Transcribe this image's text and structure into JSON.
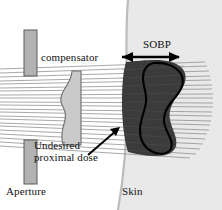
{
  "figure": {
    "labels": {
      "compensator": "compensator",
      "sobp": "SOBP",
      "undesired_dose_line1": "Undesired",
      "undesired_dose_line2": "proximal dose",
      "aperture": "Aperture",
      "skin": "Skin"
    },
    "colors": {
      "background": "#ffffff",
      "aperture_fill": "#b0b0b0",
      "aperture_stroke": "#555555",
      "compensator_fill": "#c9c9c9",
      "compensator_stroke": "#6a6a6a",
      "body_fill": "#e8e8e8",
      "skin_stroke": "#b8b8b8",
      "dose_region_fill": "#3a3a3a",
      "tumor_stroke": "#000000",
      "beam_line": "#8e8e8e",
      "text": "#121212",
      "arrow": "#000000"
    },
    "elements": {
      "aperture_upper_block": "vertical gray bar above beam gap",
      "aperture_lower_block": "vertical gray bar below beam gap",
      "compensator_shape": "light gray wedge with wavy left edge",
      "skin_boundary": "curved vertical body surface line",
      "dose_region": "dark shaded proximal dose volume",
      "tumor_outline": "S-shaped target volume contour",
      "sobp_arrow": "double-headed horizontal arrow",
      "pointer_arrow": "single-headed arrow to dose region",
      "beam_lines_count": 22
    }
  }
}
